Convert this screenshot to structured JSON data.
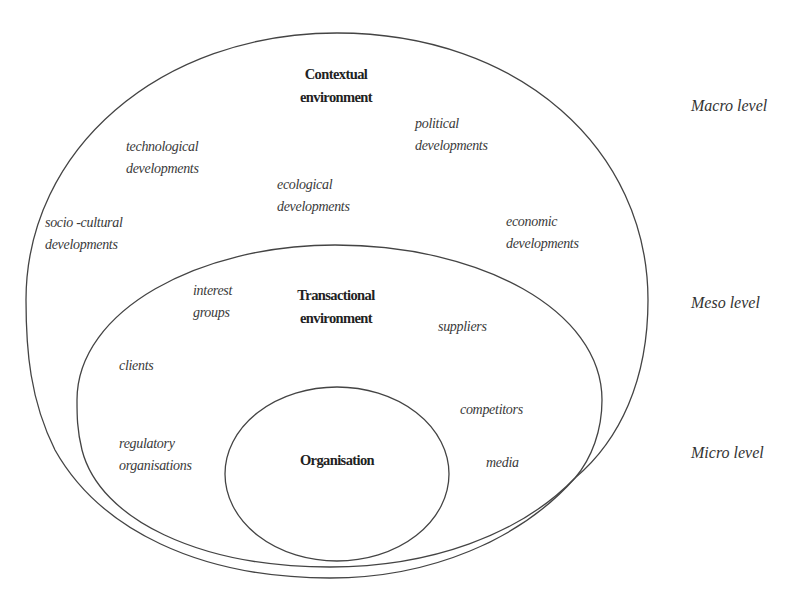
{
  "diagram": {
    "type": "nested-environment-model",
    "zones": {
      "contextual": {
        "title_line1": "Contextual",
        "title_line2": "environment"
      },
      "transactional": {
        "title_line1": "Transactional",
        "title_line2": "environment"
      },
      "organisation": {
        "title": "Organisation"
      }
    },
    "contextual_factors": [
      {
        "line1": "technological",
        "line2": "developments"
      },
      {
        "line1": "political",
        "line2": "developments"
      },
      {
        "line1": "ecological",
        "line2": "developments"
      },
      {
        "line1": "socio -cultural",
        "line2": "developments"
      },
      {
        "line1": "economic",
        "line2": "developments"
      }
    ],
    "transactional_factors": [
      {
        "line1": "interest",
        "line2": "groups"
      },
      {
        "line1": "suppliers"
      },
      {
        "line1": "clients"
      },
      {
        "line1": "competitors"
      },
      {
        "line1": "regulatory",
        "line2": "organisations"
      },
      {
        "line1": "media"
      }
    ],
    "levels": [
      {
        "label": "Macro level"
      },
      {
        "label": "Meso level"
      },
      {
        "label": "Micro level"
      }
    ],
    "colors": {
      "stroke": "#444444",
      "text": "#3a3a3a",
      "background": "#ffffff"
    }
  }
}
